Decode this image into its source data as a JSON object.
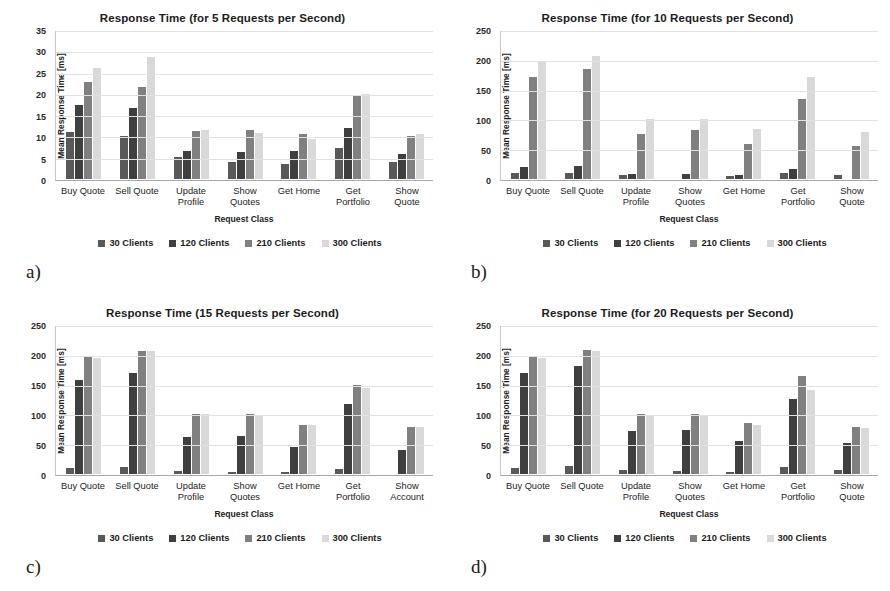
{
  "figure": {
    "panels": [
      {
        "letter": "a)",
        "key": "chart_a"
      },
      {
        "letter": "b)",
        "key": "chart_b"
      },
      {
        "letter": "c)",
        "key": "chart_c"
      },
      {
        "letter": "d)",
        "key": "chart_d"
      }
    ]
  },
  "legend": {
    "position": "bottom-center",
    "entries": [
      {
        "label": "30 Clients",
        "color": "#595959"
      },
      {
        "label": "120 Clients",
        "color": "#3f3f3f"
      },
      {
        "label": "210 Clients",
        "color": "#808080"
      },
      {
        "label": "300 Clients",
        "color": "#d9d9d9"
      }
    ]
  },
  "chart_data": [
    {
      "id": "chart_a",
      "panel": "a)",
      "type": "bar",
      "title": "Response Time (for 5 Requests per Second)",
      "xlabel": "Request Class",
      "ylabel": "Mean Response Time [ms]",
      "ylim": [
        0,
        35
      ],
      "yticks": [
        0,
        5,
        10,
        15,
        20,
        25,
        30,
        35
      ],
      "grid": true,
      "categories": [
        "Buy Quote",
        "Sell Quote",
        "Update\nProfile",
        "Show\nQuotes",
        "Get Home",
        "Get\nPortfolio",
        "Show\nQuote"
      ],
      "series": [
        {
          "name": "30 Clients",
          "color": "#595959",
          "values": [
            11.2,
            10.2,
            5.3,
            4.1,
            3.5,
            7.4,
            4.1
          ]
        },
        {
          "name": "120 Clients",
          "color": "#3f3f3f",
          "values": [
            17.5,
            16.7,
            6.7,
            6.3,
            6.6,
            12.1,
            5.9
          ]
        },
        {
          "name": "210 Clients",
          "color": "#808080",
          "values": [
            23.0,
            21.8,
            11.3,
            11.6,
            10.7,
            19.7,
            10.2
          ]
        },
        {
          "name": "300 Clients",
          "color": "#d9d9d9",
          "values": [
            26.3,
            28.9,
            11.5,
            10.9,
            9.4,
            20.2,
            10.7
          ]
        }
      ]
    },
    {
      "id": "chart_b",
      "panel": "b)",
      "type": "bar",
      "title": "Response Time (for 10 Requests per Second)",
      "xlabel": "Request Class",
      "ylabel": "Mean Response Time [ms]",
      "ylim": [
        0,
        250
      ],
      "yticks": [
        0,
        50,
        100,
        150,
        200,
        250
      ],
      "grid": true,
      "categories": [
        "Buy Quote",
        "Sell Quote",
        "Update\nProfile",
        "Show\nQuotes",
        "Get Home",
        "Get\nPortfolio",
        "Show\nQuote"
      ],
      "series": [
        {
          "name": "30 Clients",
          "color": "#595959",
          "values": [
            10,
            11,
            6,
            0,
            5,
            11,
            7
          ]
        },
        {
          "name": "120 Clients",
          "color": "#3f3f3f",
          "values": [
            20,
            22,
            9,
            8,
            7,
            17,
            0
          ]
        },
        {
          "name": "210 Clients",
          "color": "#808080",
          "values": [
            172,
            186,
            76,
            82,
            59,
            135,
            55
          ]
        },
        {
          "name": "300 Clients",
          "color": "#d9d9d9",
          "values": [
            198,
            208,
            102,
            101,
            85,
            172,
            80
          ]
        }
      ]
    },
    {
      "id": "chart_c",
      "panel": "c)",
      "type": "bar",
      "title": "Response Time (15 Requests per Second)",
      "xlabel": "Request Class",
      "ylabel": "Mean Response Time [ms]",
      "ylim": [
        0,
        250
      ],
      "yticks": [
        0,
        50,
        100,
        150,
        200,
        250
      ],
      "grid": true,
      "categories": [
        "Buy Quote",
        "Sell Quote",
        "Update\nProfile",
        "Show\nQuotes",
        "Get Home",
        "Get\nPortfolio",
        "Show\nAccount"
      ],
      "series": [
        {
          "name": "30 Clients",
          "color": "#595959",
          "values": [
            11,
            12,
            5,
            4,
            4,
            8,
            0
          ]
        },
        {
          "name": "120 Clients",
          "color": "#3f3f3f",
          "values": [
            159,
            170,
            62,
            64,
            45,
            118,
            40
          ]
        },
        {
          "name": "210 Clients",
          "color": "#808080",
          "values": [
            199,
            208,
            101,
            102,
            82,
            150,
            79
          ]
        },
        {
          "name": "300 Clients",
          "color": "#d9d9d9",
          "values": [
            196,
            208,
            101,
            100,
            82,
            146,
            79
          ]
        }
      ]
    },
    {
      "id": "chart_d",
      "panel": "d)",
      "type": "bar",
      "title": "Response Time (for 20 Requests per Second)",
      "xlabel": "Request Class",
      "ylabel": "Mean Response Time [ms]",
      "ylim": [
        0,
        250
      ],
      "yticks": [
        0,
        50,
        100,
        150,
        200,
        250
      ],
      "grid": true,
      "categories": [
        "Buy Quote",
        "Sell Quote",
        "Update\nProfile",
        "Show\nQuotes",
        "Get Home",
        "Get\nPortfolio",
        "Show\nQuote"
      ],
      "series": [
        {
          "name": "30 Clients",
          "color": "#595959",
          "values": [
            11,
            13,
            7,
            5,
            4,
            12,
            6
          ]
        },
        {
          "name": "120 Clients",
          "color": "#3f3f3f",
          "values": [
            170,
            182,
            73,
            74,
            56,
            127,
            52
          ]
        },
        {
          "name": "210 Clients",
          "color": "#808080",
          "values": [
            197,
            210,
            101,
            101,
            86,
            165,
            79
          ]
        },
        {
          "name": "300 Clients",
          "color": "#d9d9d9",
          "values": [
            196,
            208,
            100,
            100,
            83,
            142,
            78
          ]
        }
      ]
    }
  ]
}
